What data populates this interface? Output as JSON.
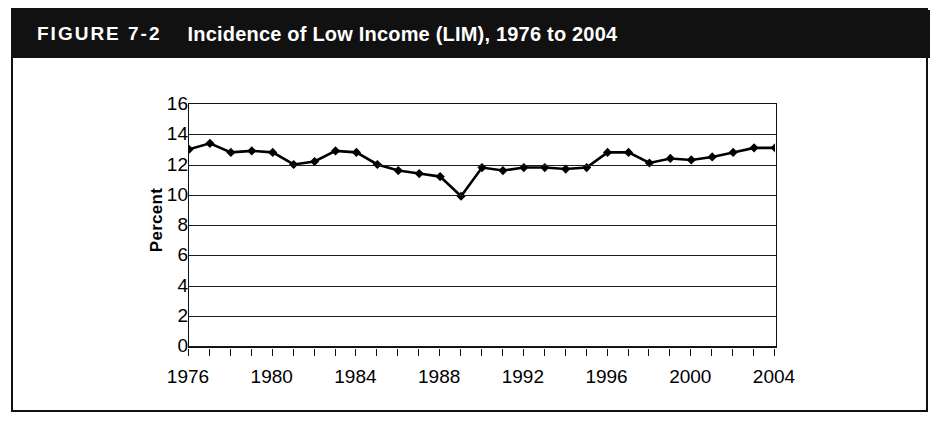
{
  "figure": {
    "number_label": "FIGURE 7-2",
    "title": "Incidence of Low Income (LIM), 1976 to 2004"
  },
  "colors": {
    "banner_background": "#111111",
    "banner_text": "#ffffff",
    "plot_frame": "#111111",
    "gridline": "#1a1a1a",
    "series_line": "#000000",
    "figure_background": "#ffffff"
  },
  "chart_data": {
    "type": "line",
    "title": "Incidence of Low Income (LIM), 1976 to 2004",
    "xlabel": "",
    "ylabel": "Percent",
    "xlim": [
      1976,
      2004
    ],
    "ylim": [
      0,
      16
    ],
    "ytick_step": 2,
    "xtick_step": 1,
    "xtick_label_step": 4,
    "grid": true,
    "legend": "none",
    "marker": "diamond",
    "yticks": [
      0,
      2,
      4,
      6,
      8,
      10,
      12,
      14,
      16
    ],
    "ytick_labels": [
      "0",
      "2",
      "4",
      "6",
      "8",
      "10",
      "12",
      "14",
      "16"
    ],
    "xtick_labels": [
      "1976",
      "1980",
      "1984",
      "1988",
      "1992",
      "1996",
      "2000",
      "2004"
    ],
    "x": [
      1976,
      1977,
      1978,
      1979,
      1980,
      1981,
      1982,
      1983,
      1984,
      1985,
      1986,
      1987,
      1988,
      1989,
      1990,
      1991,
      1992,
      1993,
      1994,
      1995,
      1996,
      1997,
      1998,
      1999,
      2000,
      2001,
      2002,
      2003,
      2004
    ],
    "values": [
      13.0,
      13.4,
      12.8,
      12.9,
      12.8,
      12.0,
      12.2,
      12.9,
      12.8,
      12.0,
      11.6,
      11.4,
      11.2,
      9.9,
      11.8,
      11.6,
      11.8,
      11.8,
      11.7,
      11.8,
      12.8,
      12.8,
      12.1,
      12.4,
      12.3,
      12.5,
      12.8,
      13.1,
      13.1
    ],
    "series": [
      {
        "name": "Incidence of Low Income (LIM)",
        "values": [
          13.0,
          13.4,
          12.8,
          12.9,
          12.8,
          12.0,
          12.2,
          12.9,
          12.8,
          12.0,
          11.6,
          11.4,
          11.2,
          9.9,
          11.8,
          11.6,
          11.8,
          11.8,
          11.7,
          11.8,
          12.8,
          12.8,
          12.1,
          12.4,
          12.3,
          12.5,
          12.8,
          13.1,
          13.1
        ]
      }
    ]
  }
}
